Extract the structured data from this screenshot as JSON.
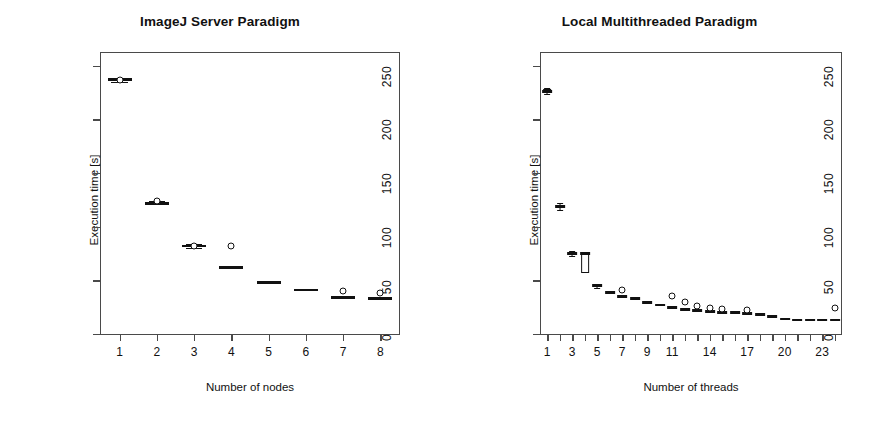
{
  "figure": {
    "ylabel": "Execution time [s]",
    "yticks": [
      0,
      50,
      100,
      150,
      200,
      250
    ],
    "ylim": [
      0,
      262
    ]
  },
  "chart_data": [
    {
      "type": "box",
      "title": "ImageJ Server Paradigm",
      "xlabel": "Number of nodes",
      "ylabel": "Execution time [s]",
      "ylim": [
        0,
        262
      ],
      "yticks": [
        0,
        50,
        100,
        150,
        200,
        250
      ],
      "xticks": [
        1,
        2,
        3,
        4,
        5,
        6,
        7,
        8
      ],
      "xticklabels": [
        "1",
        "2",
        "3",
        "4",
        "5",
        "6",
        "7",
        "8"
      ],
      "grid": false,
      "legend": "none",
      "categories": [
        "1",
        "2",
        "3",
        "4",
        "5",
        "6",
        "7",
        "8"
      ],
      "values": [
        237,
        122,
        82,
        62,
        48,
        41,
        34,
        33
      ],
      "boxes": [
        {
          "x": 1,
          "q1": 236,
          "median": 237,
          "q3": 238,
          "low": 235,
          "high": 239,
          "outliers": [
            237
          ]
        },
        {
          "x": 2,
          "q1": 121,
          "median": 122,
          "q3": 123,
          "low": 121,
          "high": 124,
          "outliers": [
            124
          ]
        },
        {
          "x": 3,
          "q1": 81,
          "median": 82,
          "q3": 83,
          "low": 80,
          "high": 84,
          "outliers": [
            82
          ]
        },
        {
          "x": 4,
          "q1": 61,
          "median": 62,
          "q3": 63,
          "low": 61,
          "high": 63,
          "outliers": [
            82
          ]
        },
        {
          "x": 5,
          "q1": 47,
          "median": 48,
          "q3": 49,
          "low": 47,
          "high": 49,
          "outliers": []
        },
        {
          "x": 6,
          "q1": 40,
          "median": 41,
          "q3": 42,
          "low": 40,
          "high": 42,
          "outliers": []
        },
        {
          "x": 7,
          "q1": 33,
          "median": 34,
          "q3": 35,
          "low": 33,
          "high": 35,
          "outliers": [
            40
          ]
        },
        {
          "x": 8,
          "q1": 32,
          "median": 33,
          "q3": 34,
          "low": 32,
          "high": 34,
          "outliers": [
            38
          ]
        }
      ]
    },
    {
      "type": "box",
      "title": "Local Multithreaded Paradigm",
      "xlabel": "Number of threads",
      "ylabel": "Execution time [s]",
      "ylim": [
        0,
        262
      ],
      "yticks": [
        0,
        50,
        100,
        150,
        200,
        250
      ],
      "xticks": [
        1,
        2,
        3,
        4,
        5,
        6,
        7,
        8,
        9,
        10,
        11,
        12,
        13,
        14,
        15,
        16,
        17,
        18,
        19,
        20,
        21,
        22,
        23,
        24
      ],
      "xticklabels": [
        "1",
        "",
        "3",
        "",
        "5",
        "",
        "7",
        "",
        "9",
        "",
        "11",
        "",
        "",
        "14",
        "",
        "",
        "17",
        "",
        "",
        "20",
        "",
        "",
        "23",
        ""
      ],
      "grid": false,
      "legend": "none",
      "categories": [
        "1",
        "2",
        "3",
        "4",
        "5",
        "6",
        "7",
        "8",
        "9",
        "10",
        "11",
        "12",
        "13",
        "14",
        "15",
        "16",
        "17",
        "18",
        "19",
        "20",
        "21",
        "22",
        "23",
        "24"
      ],
      "values": [
        226,
        119,
        75,
        66,
        45,
        39,
        35,
        33,
        29,
        27,
        25,
        23,
        22,
        21,
        20,
        20,
        19,
        18,
        16,
        14,
        13,
        13,
        13,
        13
      ],
      "boxes": [
        {
          "x": 1,
          "q1": 225,
          "median": 226,
          "q3": 228,
          "low": 224,
          "high": 229,
          "outliers": []
        },
        {
          "x": 2,
          "q1": 118,
          "median": 119,
          "q3": 120,
          "low": 116,
          "high": 122,
          "outliers": []
        },
        {
          "x": 3,
          "q1": 74,
          "median": 75,
          "q3": 76,
          "low": 73,
          "high": 77,
          "outliers": []
        },
        {
          "x": 4,
          "q1": 57,
          "median": 75,
          "q3": 75,
          "low": 57,
          "high": 75,
          "outliers": []
        },
        {
          "x": 5,
          "q1": 44,
          "median": 45,
          "q3": 46,
          "low": 43,
          "high": 47,
          "outliers": []
        },
        {
          "x": 6,
          "q1": 38,
          "median": 39,
          "q3": 40,
          "low": 38,
          "high": 40,
          "outliers": []
        },
        {
          "x": 7,
          "q1": 34,
          "median": 35,
          "q3": 36,
          "low": 34,
          "high": 36,
          "outliers": [
            41
          ]
        },
        {
          "x": 8,
          "q1": 32,
          "median": 33,
          "q3": 34,
          "low": 32,
          "high": 34,
          "outliers": []
        },
        {
          "x": 9,
          "q1": 28,
          "median": 29,
          "q3": 30,
          "low": 28,
          "high": 30,
          "outliers": []
        },
        {
          "x": 10,
          "q1": 26,
          "median": 27,
          "q3": 28,
          "low": 26,
          "high": 28,
          "outliers": []
        },
        {
          "x": 11,
          "q1": 24,
          "median": 25,
          "q3": 26,
          "low": 24,
          "high": 26,
          "outliers": [
            35
          ]
        },
        {
          "x": 12,
          "q1": 22,
          "median": 23,
          "q3": 24,
          "low": 22,
          "high": 24,
          "outliers": [
            30
          ]
        },
        {
          "x": 13,
          "q1": 21,
          "median": 22,
          "q3": 23,
          "low": 21,
          "high": 23,
          "outliers": [
            26
          ]
        },
        {
          "x": 14,
          "q1": 20,
          "median": 21,
          "q3": 22,
          "low": 20,
          "high": 22,
          "outliers": [
            24
          ]
        },
        {
          "x": 15,
          "q1": 19,
          "median": 20,
          "q3": 21,
          "low": 19,
          "high": 21,
          "outliers": [
            23
          ]
        },
        {
          "x": 16,
          "q1": 19,
          "median": 20,
          "q3": 21,
          "low": 19,
          "high": 21,
          "outliers": []
        },
        {
          "x": 17,
          "q1": 18,
          "median": 19,
          "q3": 20,
          "low": 18,
          "high": 20,
          "outliers": [
            22
          ]
        },
        {
          "x": 18,
          "q1": 17,
          "median": 18,
          "q3": 19,
          "low": 17,
          "high": 19,
          "outliers": []
        },
        {
          "x": 19,
          "q1": 15,
          "median": 16,
          "q3": 17,
          "low": 15,
          "high": 17,
          "outliers": []
        },
        {
          "x": 20,
          "q1": 13,
          "median": 14,
          "q3": 15,
          "low": 13,
          "high": 15,
          "outliers": []
        },
        {
          "x": 21,
          "q1": 12,
          "median": 13,
          "q3": 14,
          "low": 12,
          "high": 14,
          "outliers": []
        },
        {
          "x": 22,
          "q1": 12,
          "median": 13,
          "q3": 14,
          "low": 12,
          "high": 14,
          "outliers": []
        },
        {
          "x": 23,
          "q1": 12,
          "median": 13,
          "q3": 14,
          "low": 12,
          "high": 14,
          "outliers": []
        },
        {
          "x": 24,
          "q1": 12,
          "median": 13,
          "q3": 14,
          "low": 12,
          "high": 14,
          "outliers": [
            24
          ]
        }
      ]
    }
  ]
}
